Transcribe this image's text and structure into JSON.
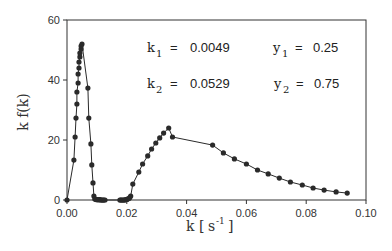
{
  "chart_data": {
    "type": "line",
    "title": "",
    "xlabel": "k [s⁻¹]",
    "ylabel": "k f(k)",
    "xlim": [
      0.0,
      0.1
    ],
    "ylim": [
      0,
      60
    ],
    "xticks": [
      "0.00",
      "0.02",
      "0.04",
      "0.06",
      "0.08",
      "0.10"
    ],
    "yticks": [
      "0",
      "20",
      "40",
      "60"
    ],
    "grid": false,
    "legend": null,
    "marker": "filled-circle",
    "line_color": "#2a2a2a",
    "series": [
      {
        "name": "k f(k)",
        "x": [
          0.0,
          0.0023,
          0.0027,
          0.003,
          0.0033,
          0.0033,
          0.0037,
          0.0037,
          0.004,
          0.004,
          0.0043,
          0.0043,
          0.0047,
          0.0047,
          0.005,
          0.007,
          0.0073,
          0.008,
          0.0083,
          0.0087,
          0.009,
          0.0093,
          0.0097,
          0.01,
          0.0103,
          0.0107,
          0.011,
          0.0113,
          0.0117,
          0.012,
          0.0123,
          0.0127,
          0.0177,
          0.018,
          0.0183,
          0.0187,
          0.019,
          0.0193,
          0.0197,
          0.02,
          0.0203,
          0.0207,
          0.021,
          0.0213,
          0.022,
          0.024,
          0.0253,
          0.027,
          0.0283,
          0.0297,
          0.031,
          0.0323,
          0.034,
          0.0353,
          0.0487,
          0.0523,
          0.056,
          0.06,
          0.0637,
          0.0673,
          0.071,
          0.0747,
          0.0787,
          0.0823,
          0.086,
          0.09,
          0.0937
        ],
        "y": [
          0.0,
          13.3,
          21.0,
          27.3,
          32.0,
          36.0,
          39.0,
          42.0,
          44.0,
          46.0,
          47.7,
          49.0,
          50.3,
          51.3,
          52.0,
          37.3,
          27.3,
          18.7,
          11.7,
          5.7,
          1.3,
          0.3,
          0.2,
          0.1,
          0.1,
          0.1,
          0.1,
          0.0,
          0.0,
          0.0,
          0.0,
          0.0,
          0.0,
          0.0,
          0.0,
          0.0,
          0.0,
          0.0,
          0.1,
          0.2,
          0.3,
          0.5,
          0.8,
          1.3,
          5.3,
          9.3,
          12.0,
          14.7,
          17.0,
          19.0,
          20.7,
          22.3,
          24.0,
          21.0,
          18.3,
          15.7,
          13.7,
          12.0,
          10.0,
          8.7,
          7.3,
          6.0,
          5.0,
          4.0,
          3.3,
          2.7,
          2.3
        ]
      }
    ],
    "annotations": [
      {
        "text": "k₁ = 0.0049",
        "label": "k",
        "sub": "1",
        "value": "0.0049"
      },
      {
        "text": "y₁ = 0.25",
        "label": "y",
        "sub": "1",
        "value": "0.25"
      },
      {
        "text": "k₂ = 0.0529",
        "label": "k",
        "sub": "2",
        "value": "0.0529"
      },
      {
        "text": "y₂ = 0.75",
        "label": "y",
        "sub": "2",
        "value": "0.75"
      }
    ]
  },
  "labels": {
    "xlabel_main": "k",
    "xlabel_unit_open": "[",
    "xlabel_unit": "s",
    "xlabel_exp": "-1",
    "xlabel_unit_close": "]",
    "ylabel": "k f(k)",
    "eq": "="
  }
}
